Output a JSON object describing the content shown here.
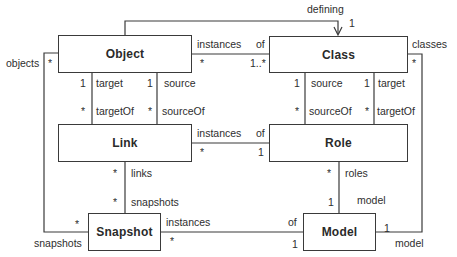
{
  "classes": {
    "object": "Object",
    "class": "Class",
    "link": "Link",
    "role": "Role",
    "snapshot": "Snapshot",
    "model": "Model"
  },
  "associations": {
    "object_class": {
      "role_object": "instances",
      "role_class": "of",
      "mult_object": "*",
      "mult_class": "1..*"
    },
    "defining": {
      "role": "defining",
      "mult": "1"
    },
    "object_link_target": {
      "mult_object": "1",
      "role_object": "target",
      "mult_link": "*",
      "role_link": "targetOf"
    },
    "object_link_source": {
      "mult_object": "1",
      "role_object": "source",
      "mult_link": "*",
      "role_link": "sourceOf"
    },
    "class_role_source": {
      "mult_class": "1",
      "role_class": "source",
      "mult_role": "*",
      "role_role": "sourceOf"
    },
    "class_role_target": {
      "mult_class": "1",
      "role_class": "target",
      "mult_role": "*",
      "role_role": "targetOf"
    },
    "link_role": {
      "role_link": "instances",
      "role_role": "of",
      "mult_link": "*",
      "mult_role": "1"
    },
    "object_snapshot": {
      "role_object": "objects",
      "mult_object": "*",
      "role_snapshot": "snapshots",
      "mult_snapshot": "*"
    },
    "link_snapshot": {
      "mult_link": "*",
      "role_link": "links",
      "mult_snapshot": "*",
      "role_snapshot": "snapshots"
    },
    "snapshot_model": {
      "role_snapshot": "instances",
      "mult_snapshot": "*",
      "role_model": "of",
      "mult_model": "1"
    },
    "role_model": {
      "mult_role": "*",
      "role_role": "roles",
      "mult_model": "1",
      "role_model": "model"
    },
    "class_model": {
      "role_class": "classes",
      "mult_class": "*",
      "mult_model": "1",
      "role_model": "model"
    }
  }
}
